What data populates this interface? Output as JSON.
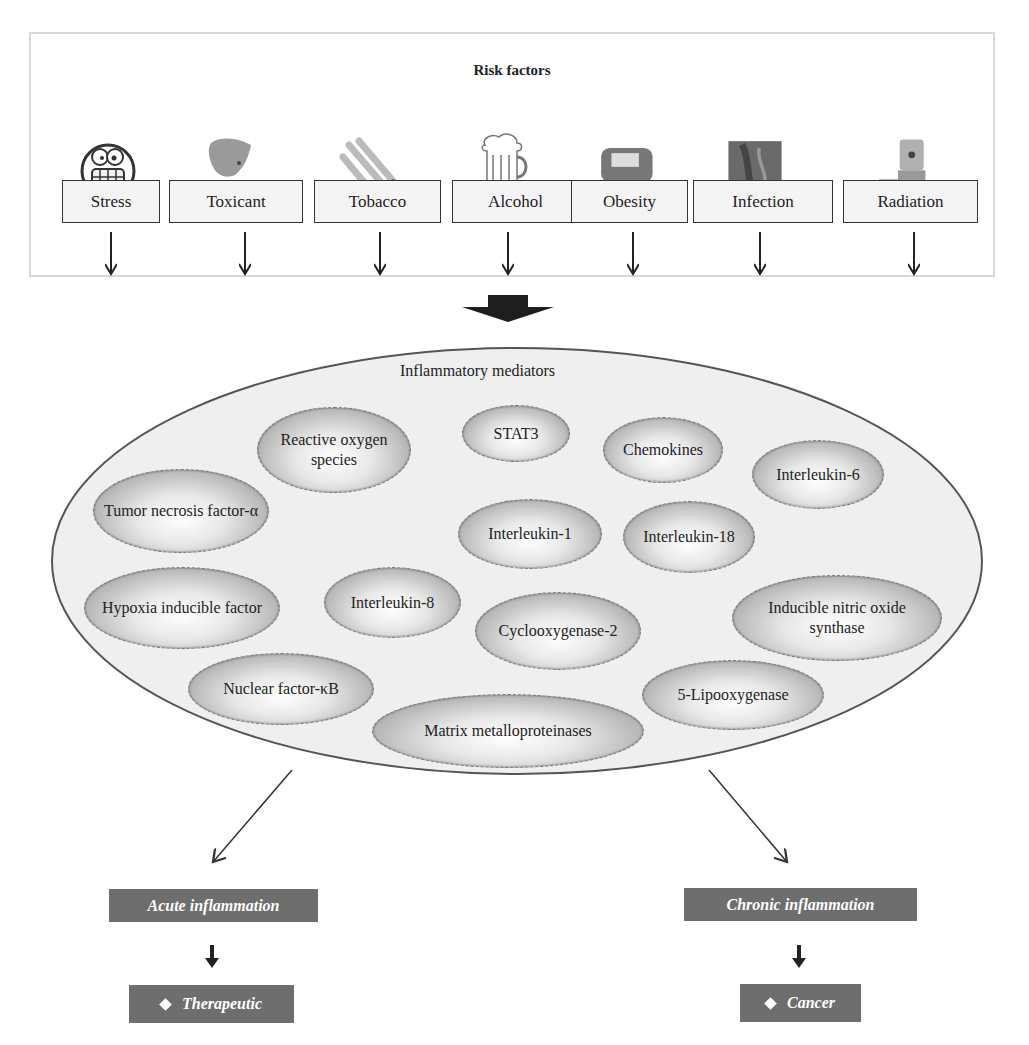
{
  "risk_factors": {
    "title": "Risk factors",
    "items": [
      {
        "label": "Stress",
        "icon": "stressed-face-icon"
      },
      {
        "label": "Toxicant",
        "icon": "toxicant-splash-icon"
      },
      {
        "label": "Tobacco",
        "icon": "cigarettes-icon"
      },
      {
        "label": "Alcohol",
        "icon": "beer-mug-icon"
      },
      {
        "label": "Obesity",
        "icon": "obesity-figure-icon"
      },
      {
        "label": "Infection",
        "icon": "infection-micrograph-icon"
      },
      {
        "label": "Radiation",
        "icon": "radiation-barrel-icon"
      }
    ]
  },
  "mediators": {
    "title": "Inflammatory mediators",
    "items": [
      "Reactive oxygen species",
      "STAT3",
      "Chemokines",
      "Interleukin-6",
      "Tumor necrosis factor-α",
      "Interleukin-1",
      "Interleukin-18",
      "Hypoxia inducible factor",
      "Interleukin-8",
      "Cyclooxygenase-2",
      "Inducible nitric oxide synthase",
      "Nuclear factor-κB",
      "5-Lipooxygenase",
      "Matrix metalloproteinases"
    ]
  },
  "outcomes": {
    "acute": {
      "label": "Acute inflammation",
      "result": "Therapeutic"
    },
    "chronic": {
      "label": "Chronic inflammation",
      "result": "Cancer"
    }
  },
  "colors": {
    "outcome_box": "#6e6e6e",
    "panel_border": "#d8d8d8",
    "ellipse_fill": "#efefef",
    "ellipse_stroke": "#555555"
  }
}
